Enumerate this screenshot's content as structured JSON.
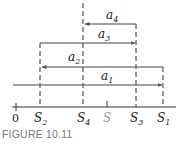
{
  "figure": {
    "caption": "FIGURE 10.11",
    "axis": {
      "labels": [
        {
          "id": "origin",
          "text": "0",
          "x": 16
        },
        {
          "id": "S2",
          "base": "S",
          "sub": "2",
          "x": 40
        },
        {
          "id": "S4",
          "base": "S",
          "sub": "4",
          "x": 83
        },
        {
          "id": "S",
          "base": "S",
          "sub": "",
          "x": 107,
          "color": "#999999"
        },
        {
          "id": "S3",
          "base": "S",
          "sub": "3",
          "x": 136
        },
        {
          "id": "S1",
          "base": "S",
          "sub": "1",
          "x": 163
        }
      ]
    },
    "arrows": [
      {
        "id": "a4",
        "base": "a",
        "sub": "4",
        "direction": "left",
        "from": "S3",
        "to": "S4"
      },
      {
        "id": "a3",
        "base": "a",
        "sub": "3",
        "direction": "right",
        "from": "S2",
        "to": "S3"
      },
      {
        "id": "a2",
        "base": "a",
        "sub": "2",
        "direction": "left",
        "from": "S1",
        "to": "S2"
      },
      {
        "id": "a1",
        "base": "a",
        "sub": "1",
        "direction": "right",
        "from": "0",
        "to": "S1"
      }
    ],
    "colors": {
      "line": "#333333",
      "muted": "#999999",
      "caption": "#777777"
    }
  }
}
